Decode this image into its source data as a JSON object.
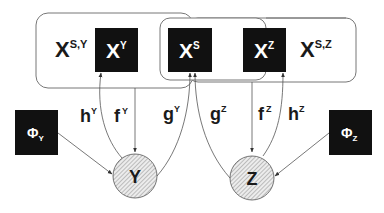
{
  "diagram": {
    "colors": {
      "box_fill": "#111111",
      "box_text": "#ffffff",
      "line": "#555555",
      "frame": "#777777",
      "node_hatch": "#888888",
      "node_fill": "#e8e8e8",
      "text": "#1a1a1a"
    },
    "groups": [
      {
        "id": "group-y",
        "label_base": "X",
        "label_sup": "S,Y"
      },
      {
        "id": "group-s"
      },
      {
        "id": "group-z",
        "label_base": "X",
        "label_sup": "S,Z"
      }
    ],
    "boxes": {
      "xy": {
        "base": "X",
        "sup": "Y"
      },
      "xs": {
        "base": "X",
        "sup": "S"
      },
      "xz": {
        "base": "X",
        "sup": "Z"
      },
      "phi_y": {
        "base": "Φ",
        "sub": "Y"
      },
      "phi_z": {
        "base": "Φ",
        "sub": "Z"
      }
    },
    "nodes": {
      "y": {
        "label": "Y"
      },
      "z": {
        "label": "Z"
      }
    },
    "edges": {
      "hy": {
        "base": "h",
        "sup": "Y"
      },
      "fy": {
        "base": "f",
        "sup": "Y"
      },
      "gy": {
        "base": "g",
        "sup": "Y"
      },
      "gz": {
        "base": "g",
        "sup": "Z"
      },
      "fz": {
        "base": "f",
        "sup": "Z"
      },
      "hz": {
        "base": "h",
        "sup": "Z"
      }
    }
  }
}
